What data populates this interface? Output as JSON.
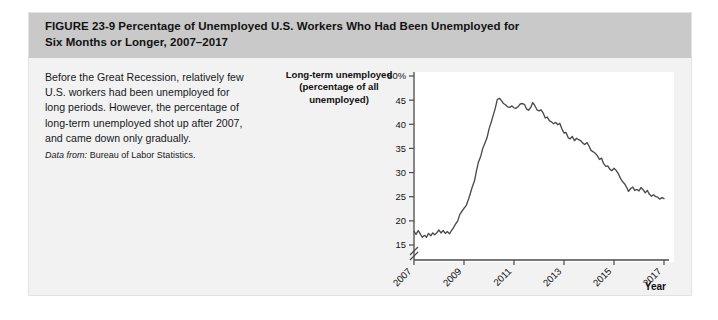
{
  "figure": {
    "number_label": "FIGURE  23-9",
    "title_line1": "Percentage of Unemployed U.S. Workers Who Had Been Unemployed for",
    "title_line2": "Six Months or Longer, 2007–2017",
    "caption": "Before the Great Recession, relatively few U.S. workers had been unemployed for long periods. However, the percentage of long-term unemployed shot up after 2007, and came down only gradually.",
    "source_lead": "Data from:",
    "source_text": " Bureau of Labor Statistics.",
    "header_bg": "#c9c9c9",
    "body_bg": "#f2f2f2",
    "plot_bg": "#ffffff",
    "line_color": "#4a4a4a"
  },
  "chart_data": {
    "type": "line",
    "title": "Percentage of Unemployed U.S. Workers Who Had Been Unemployed for Six Months or Longer, 2007–2017",
    "xlabel": "Year",
    "ylabel": "Long-term unemployed (percentage of all unemployed)",
    "ylabel_line1": "Long-term unemployed",
    "ylabel_line2": "(percentage of all",
    "ylabel_line3": "unemployed)",
    "grid": false,
    "legend": "none",
    "axis_break": true,
    "ylim": [
      15,
      50
    ],
    "xlim": [
      2007,
      2017
    ],
    "yticks": [
      50,
      45,
      40,
      35,
      30,
      25,
      20,
      15
    ],
    "ytick_labels": [
      "50%",
      "45",
      "40",
      "35",
      "30",
      "25",
      "20",
      "15"
    ],
    "xticks": [
      2007,
      2009,
      2011,
      2013,
      2015,
      2017
    ],
    "xtick_labels": [
      "2007",
      "2009",
      "2011",
      "2013",
      "2015",
      "2017"
    ],
    "series": [
      {
        "name": "Long-term unemployed share",
        "x": [
          2007.0,
          2007.08,
          2007.17,
          2007.25,
          2007.33,
          2007.42,
          2007.5,
          2007.58,
          2007.67,
          2007.75,
          2007.83,
          2007.92,
          2008.0,
          2008.08,
          2008.17,
          2008.25,
          2008.33,
          2008.42,
          2008.5,
          2008.58,
          2008.67,
          2008.75,
          2008.83,
          2008.92,
          2009.0,
          2009.08,
          2009.17,
          2009.25,
          2009.33,
          2009.42,
          2009.5,
          2009.58,
          2009.67,
          2009.75,
          2009.83,
          2009.92,
          2010.0,
          2010.08,
          2010.17,
          2010.25,
          2010.33,
          2010.42,
          2010.5,
          2010.58,
          2010.67,
          2010.75,
          2010.83,
          2010.92,
          2011.0,
          2011.08,
          2011.17,
          2011.25,
          2011.33,
          2011.42,
          2011.5,
          2011.58,
          2011.67,
          2011.75,
          2011.83,
          2011.92,
          2012.0,
          2012.08,
          2012.17,
          2012.25,
          2012.33,
          2012.42,
          2012.5,
          2012.58,
          2012.67,
          2012.75,
          2012.83,
          2012.92,
          2013.0,
          2013.08,
          2013.17,
          2013.25,
          2013.33,
          2013.42,
          2013.5,
          2013.58,
          2013.67,
          2013.75,
          2013.83,
          2013.92,
          2014.0,
          2014.08,
          2014.17,
          2014.25,
          2014.33,
          2014.42,
          2014.5,
          2014.58,
          2014.67,
          2014.75,
          2014.83,
          2014.92,
          2015.0,
          2015.08,
          2015.17,
          2015.25,
          2015.33,
          2015.42,
          2015.5,
          2015.58,
          2015.67,
          2015.75,
          2015.83,
          2015.92,
          2016.0,
          2016.08,
          2016.17,
          2016.25,
          2016.33,
          2016.42,
          2016.5,
          2016.58,
          2016.67,
          2016.75,
          2016.83,
          2016.92,
          2017.0
        ],
        "y": [
          17.8,
          17.2,
          18.0,
          17.3,
          16.6,
          17.0,
          16.6,
          17.4,
          16.9,
          17.5,
          17.1,
          17.6,
          18.1,
          17.5,
          18.0,
          17.4,
          17.8,
          17.3,
          18.0,
          18.6,
          19.4,
          20.0,
          21.3,
          22.0,
          22.6,
          23.1,
          24.3,
          25.6,
          27.0,
          28.3,
          30.4,
          32.2,
          33.4,
          35.0,
          36.0,
          37.2,
          39.0,
          40.3,
          41.9,
          43.3,
          45.1,
          45.4,
          44.9,
          44.3,
          44.0,
          43.6,
          43.5,
          43.8,
          43.4,
          43.3,
          43.7,
          44.2,
          44.3,
          44.1,
          43.2,
          42.9,
          43.5,
          44.5,
          43.9,
          43.0,
          42.8,
          43.0,
          42.3,
          41.3,
          41.5,
          40.7,
          40.5,
          40.1,
          40.4,
          39.9,
          40.2,
          39.0,
          38.2,
          38.3,
          37.2,
          37.0,
          37.5,
          36.6,
          37.1,
          36.8,
          36.6,
          36.1,
          35.8,
          36.2,
          35.5,
          34.6,
          34.3,
          34.0,
          33.5,
          32.7,
          33.0,
          31.9,
          31.3,
          31.4,
          30.7,
          30.4,
          30.9,
          30.5,
          29.8,
          28.9,
          28.2,
          27.7,
          27.0,
          26.1,
          26.7,
          27.0,
          26.3,
          26.5,
          26.2,
          26.9,
          26.4,
          25.8,
          26.3,
          25.5,
          25.1,
          25.4,
          25.0,
          24.9,
          24.5,
          24.8,
          24.6
        ]
      }
    ]
  }
}
